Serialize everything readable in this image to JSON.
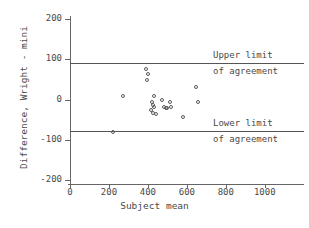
{
  "chart_data": {
    "type": "scatter",
    "title": "",
    "xlabel": "Subject mean",
    "ylabel": "Difference, Wright - mini",
    "xlim": [
      0,
      1150
    ],
    "ylim": [
      -200,
      200
    ],
    "xticks": [
      0,
      200,
      400,
      600,
      800,
      1000
    ],
    "yticks": [
      200,
      100,
      0,
      -100,
      -200
    ],
    "xtick_labels": [
      "0",
      "200",
      "400",
      "600",
      "800",
      "1000"
    ],
    "ytick_labels": [
      "200",
      "100",
      "0",
      "-100",
      "-200"
    ],
    "grid": false,
    "legend": null,
    "marker": "open-circle",
    "points": [
      {
        "x": 220,
        "y": -80
      },
      {
        "x": 271,
        "y": 9
      },
      {
        "x": 390,
        "y": 75
      },
      {
        "x": 400,
        "y": 63
      },
      {
        "x": 394,
        "y": 48
      },
      {
        "x": 430,
        "y": 8
      },
      {
        "x": 421,
        "y": -6
      },
      {
        "x": 424,
        "y": -14
      },
      {
        "x": 430,
        "y": -19
      },
      {
        "x": 418,
        "y": -25
      },
      {
        "x": 425,
        "y": -33
      },
      {
        "x": 440,
        "y": -36
      },
      {
        "x": 470,
        "y": -2
      },
      {
        "x": 482,
        "y": -18
      },
      {
        "x": 491,
        "y": -21
      },
      {
        "x": 498,
        "y": -20
      },
      {
        "x": 513,
        "y": -6
      },
      {
        "x": 516,
        "y": -19
      },
      {
        "x": 580,
        "y": -43
      },
      {
        "x": 645,
        "y": 31
      },
      {
        "x": 655,
        "y": -7
      }
    ],
    "reference_lines": [
      {
        "name": "upper-limit-of-agreement",
        "y": 90,
        "label_line1": "Upper limit",
        "label_line2": "of agreement"
      },
      {
        "name": "lower-limit-of-agreement",
        "y": -78,
        "label_line1": "Lower limit",
        "label_line2": "of agreement"
      }
    ],
    "annotations": {
      "upper_limit_line1": "Upper limit",
      "upper_limit_line2": "of agreement",
      "lower_limit_line1": "Lower limit",
      "lower_limit_line2": "of agreement"
    },
    "colors": {
      "axis": "#666666",
      "text": "#4a4a4a",
      "marker": "#5a5a5a",
      "reference_line": "#555555",
      "background": "#ffffff"
    }
  }
}
